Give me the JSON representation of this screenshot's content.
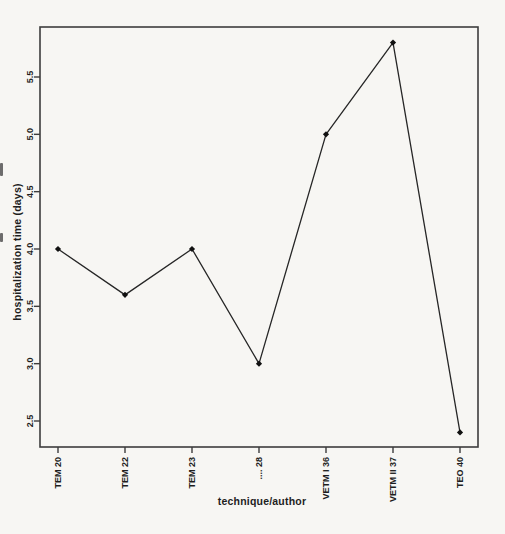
{
  "figure": {
    "background": "#f7f6f3",
    "box_color": "#3d3d3d",
    "text_color": "#1e1e1e"
  },
  "chart_data": {
    "type": "line",
    "title": "",
    "xlabel": "technique/author",
    "ylabel": "hospitalization time (days)",
    "categories": [
      "TEM 20",
      "TEM 22",
      "TEM 23",
      ".... 28",
      "VETM I 36",
      "VETM II 37",
      "TEO 40"
    ],
    "values": [
      4.0,
      3.6,
      4.0,
      3.0,
      5.0,
      5.8,
      2.4
    ],
    "yticks": [
      2.5,
      3.0,
      3.5,
      4.0,
      4.5,
      5.0,
      5.5
    ],
    "ylim": [
      2.3,
      5.95
    ],
    "grid": false,
    "legend": null,
    "line_color": "#262626",
    "marker": "diamond",
    "marker_color": "#111111",
    "tick_label_rotation_deg": -90
  }
}
